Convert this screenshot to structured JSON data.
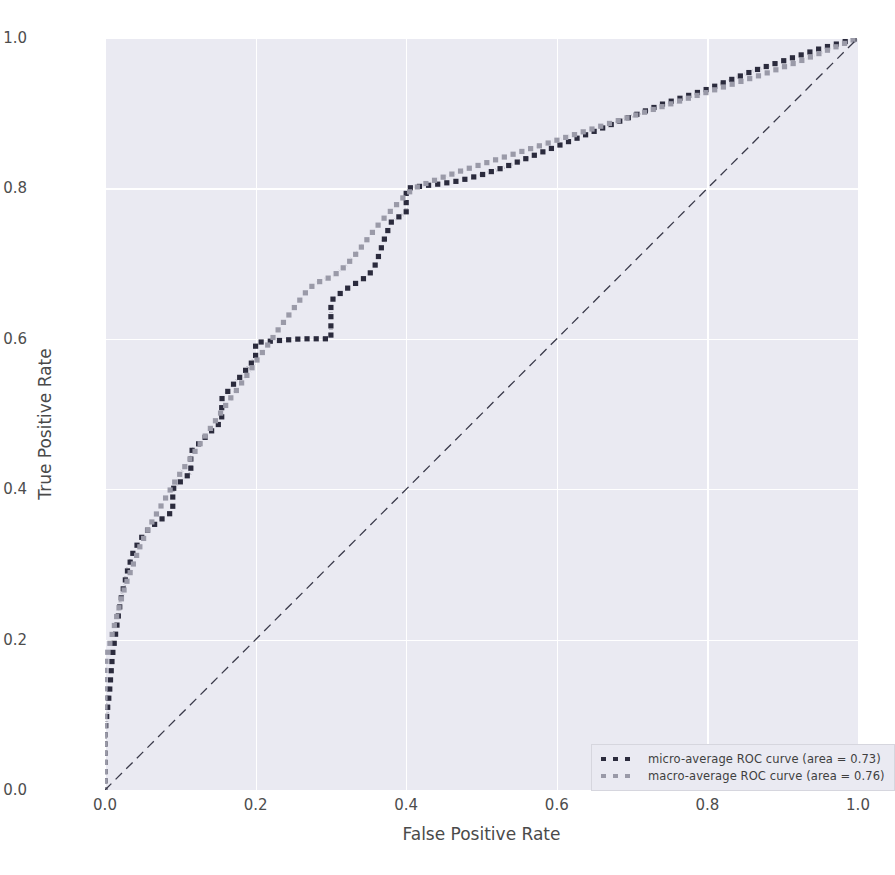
{
  "chart_data": {
    "type": "line",
    "title": "",
    "xlabel": "False Positive Rate",
    "ylabel": "True Positive Rate",
    "xlim": [
      0.0,
      1.0
    ],
    "ylim": [
      0.0,
      1.0
    ],
    "xticks": [
      "0.0",
      "0.2",
      "0.4",
      "0.6",
      "0.8",
      "1.0"
    ],
    "yticks": [
      "0.0",
      "0.2",
      "0.4",
      "0.6",
      "0.8",
      "1.0"
    ],
    "xtick_values": [
      0.0,
      0.2,
      0.4,
      0.6,
      0.8,
      1.0
    ],
    "ytick_values": [
      0.0,
      0.2,
      0.4,
      0.6,
      0.8,
      1.0
    ],
    "grid": true,
    "legend_position": "lower right",
    "style": "seaborn-darkgrid",
    "plot_background": "#eaeaf2",
    "figure_background": "#ffffff",
    "series": [
      {
        "name": "micro-average ROC curve (area = 0.73)",
        "short_name": "micro-average ROC curve",
        "area": 0.73,
        "color": "#2b2b3d",
        "linestyle": "dotted",
        "linewidth": 4,
        "x": [
          0.0,
          0.0,
          0.0,
          0.003,
          0.006,
          0.008,
          0.01,
          0.013,
          0.016,
          0.019,
          0.022,
          0.026,
          0.03,
          0.034,
          0.038,
          0.044,
          0.05,
          0.056,
          0.062,
          0.068,
          0.075,
          0.082,
          0.09,
          0.09,
          0.098,
          0.106,
          0.114,
          0.114,
          0.122,
          0.13,
          0.138,
          0.146,
          0.155,
          0.155,
          0.163,
          0.171,
          0.18,
          0.19,
          0.2,
          0.2,
          0.21,
          0.222,
          0.235,
          0.248,
          0.262,
          0.275,
          0.288,
          0.3,
          0.3,
          0.3,
          0.305,
          0.312,
          0.32,
          0.33,
          0.34,
          0.35,
          0.36,
          0.37,
          0.38,
          0.39,
          0.4,
          0.4,
          0.42,
          0.445,
          0.47,
          0.5,
          0.53,
          0.56,
          0.59,
          0.62,
          0.65,
          0.68,
          0.71,
          0.74,
          0.77,
          0.8,
          0.83,
          0.86,
          0.89,
          0.92,
          0.95,
          0.975,
          1.0
        ],
        "y": [
          0.0,
          0.03,
          0.075,
          0.105,
          0.13,
          0.155,
          0.18,
          0.2,
          0.22,
          0.24,
          0.258,
          0.275,
          0.292,
          0.305,
          0.318,
          0.328,
          0.338,
          0.345,
          0.35,
          0.355,
          0.36,
          0.365,
          0.37,
          0.4,
          0.408,
          0.415,
          0.422,
          0.45,
          0.458,
          0.466,
          0.474,
          0.482,
          0.49,
          0.52,
          0.53,
          0.54,
          0.55,
          0.562,
          0.575,
          0.595,
          0.596,
          0.597,
          0.598,
          0.599,
          0.6,
          0.6,
          0.6,
          0.6,
          0.625,
          0.65,
          0.655,
          0.66,
          0.666,
          0.672,
          0.678,
          0.684,
          0.7,
          0.73,
          0.755,
          0.762,
          0.768,
          0.8,
          0.803,
          0.806,
          0.81,
          0.818,
          0.828,
          0.84,
          0.852,
          0.864,
          0.876,
          0.888,
          0.9,
          0.912,
          0.922,
          0.932,
          0.944,
          0.956,
          0.966,
          0.976,
          0.986,
          0.993,
          1.0
        ]
      },
      {
        "name": "macro-average ROC curve (area = 0.76)",
        "short_name": "macro-average ROC curve",
        "area": 0.76,
        "color": "#9a9aa8",
        "linestyle": "dotted",
        "linewidth": 4,
        "x": [
          0.0,
          0.0,
          0.004,
          0.009,
          0.014,
          0.019,
          0.024,
          0.03,
          0.036,
          0.042,
          0.048,
          0.055,
          0.062,
          0.07,
          0.078,
          0.086,
          0.094,
          0.102,
          0.11,
          0.118,
          0.126,
          0.134,
          0.142,
          0.15,
          0.158,
          0.166,
          0.175,
          0.184,
          0.193,
          0.202,
          0.212,
          0.222,
          0.232,
          0.243,
          0.254,
          0.265,
          0.277,
          0.289,
          0.3,
          0.312,
          0.324,
          0.336,
          0.348,
          0.36,
          0.372,
          0.385,
          0.398,
          0.41,
          0.43,
          0.452,
          0.475,
          0.5,
          0.525,
          0.55,
          0.575,
          0.6,
          0.625,
          0.65,
          0.675,
          0.7,
          0.725,
          0.75,
          0.775,
          0.8,
          0.825,
          0.85,
          0.875,
          0.9,
          0.925,
          0.95,
          0.975,
          1.0
        ],
        "y": [
          0.0,
          0.165,
          0.185,
          0.205,
          0.225,
          0.244,
          0.262,
          0.28,
          0.296,
          0.312,
          0.328,
          0.342,
          0.356,
          0.37,
          0.384,
          0.398,
          0.412,
          0.424,
          0.436,
          0.448,
          0.46,
          0.472,
          0.484,
          0.496,
          0.508,
          0.52,
          0.532,
          0.545,
          0.558,
          0.572,
          0.586,
          0.6,
          0.615,
          0.63,
          0.645,
          0.66,
          0.672,
          0.678,
          0.682,
          0.69,
          0.702,
          0.716,
          0.732,
          0.748,
          0.762,
          0.776,
          0.79,
          0.8,
          0.808,
          0.816,
          0.824,
          0.832,
          0.84,
          0.848,
          0.856,
          0.864,
          0.872,
          0.88,
          0.888,
          0.896,
          0.904,
          0.912,
          0.92,
          0.928,
          0.936,
          0.944,
          0.952,
          0.961,
          0.97,
          0.98,
          0.99,
          1.0
        ]
      },
      {
        "name": "chance-diagonal",
        "short_name": "chance diagonal",
        "area": 0.5,
        "color": "#3a3a4a",
        "linestyle": "dashed",
        "linewidth": 1.3,
        "x": [
          0.0,
          1.0
        ],
        "y": [
          0.0,
          1.0
        ],
        "in_legend": false
      }
    ]
  },
  "legend": {
    "entries": [
      {
        "label": "micro-average ROC curve (area = 0.73)",
        "color": "#2b2b3d"
      },
      {
        "label": "macro-average ROC curve (area = 0.76)",
        "color": "#9a9aa8"
      }
    ]
  },
  "axis_titles": {
    "x": "False Positive Rate",
    "y": "True Positive Rate"
  },
  "ticks": {
    "x": [
      "0.0",
      "0.2",
      "0.4",
      "0.6",
      "0.8",
      "1.0"
    ],
    "y": [
      "0.0",
      "0.2",
      "0.4",
      "0.6",
      "0.8",
      "1.0"
    ]
  }
}
